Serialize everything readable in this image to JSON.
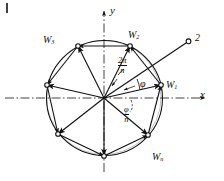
{
  "figure": {
    "kind": "hand-drawn-math-diagram",
    "ink_color": "#111111",
    "background_color": "#ffffff",
    "corner_tick": "|"
  },
  "axes": {
    "x_label": "x",
    "y_label": "y",
    "x_axis_style": "dash-dot",
    "y_axis_style": "dash-dot",
    "origin": {
      "x": 104,
      "y": 98
    }
  },
  "circle": {
    "center_x": 104,
    "center_y": 98,
    "radius": 58
  },
  "vertices": [
    {
      "id": "w1",
      "label": "W",
      "subscript": "1",
      "angle_deg": 13,
      "labeled": true
    },
    {
      "id": "w2",
      "label": "W",
      "subscript": "2",
      "angle_deg": 64,
      "labeled": true
    },
    {
      "id": "w3",
      "label": "W",
      "subscript": "3",
      "angle_deg": 116,
      "labeled": true
    },
    {
      "id": "v4",
      "label": "",
      "subscript": "",
      "angle_deg": 167,
      "labeled": false
    },
    {
      "id": "v5",
      "label": "",
      "subscript": "",
      "angle_deg": 218,
      "labeled": false
    },
    {
      "id": "v6",
      "label": "",
      "subscript": "",
      "angle_deg": 269,
      "labeled": false
    },
    {
      "id": "wn",
      "label": "W",
      "subscript": "n",
      "angle_deg": 320,
      "labeled": true
    }
  ],
  "annotations": {
    "angle_step": {
      "numerator": "2π",
      "denominator": "n"
    },
    "angle_phi": "φ",
    "angle_phi_over_n": {
      "numerator": "φ",
      "denominator": "n"
    },
    "ray_point_label": "2"
  },
  "ray": {
    "from_x": 104,
    "from_y": 98,
    "to_x": 189,
    "to_y": 41,
    "endpoint_marker": "open-circle"
  }
}
